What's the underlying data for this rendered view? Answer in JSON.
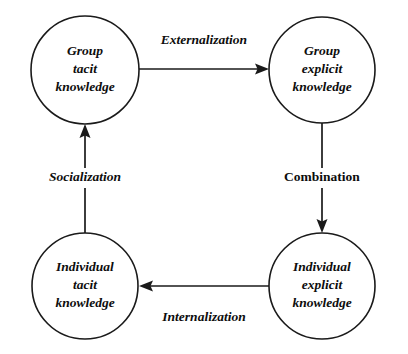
{
  "diagram": {
    "background_color": "#ffffff",
    "stroke_color": "#1a1a1a",
    "text_color": "#0d0d0d",
    "nodes": [
      {
        "id": "group-tacit",
        "lines": [
          "Group",
          "tacit",
          "knowledge"
        ],
        "cx": 85,
        "cy": 70,
        "r": 54
      },
      {
        "id": "group-explicit",
        "lines": [
          "Group",
          "explicit",
          "knowledge"
        ],
        "cx": 322,
        "cy": 70,
        "r": 53
      },
      {
        "id": "individual-tacit",
        "lines": [
          "Individual",
          "tacit",
          "knowledge"
        ],
        "cx": 85,
        "cy": 286,
        "r": 53
      },
      {
        "id": "individual-explicit",
        "lines": [
          "Individual",
          "explicit",
          "knowledge"
        ],
        "cx": 322,
        "cy": 286,
        "r": 53
      }
    ],
    "edges": [
      {
        "id": "externalization",
        "label": "Externalization",
        "from": "group-tacit",
        "to": "group-explicit",
        "direction": "right",
        "italic": true,
        "label_x": 204,
        "label_y": 41
      },
      {
        "id": "combination",
        "label": "Combination",
        "from": "group-explicit",
        "to": "individual-explicit",
        "direction": "down",
        "italic": false,
        "label_x": 322,
        "label_y": 178
      },
      {
        "id": "internalization",
        "label": "Internalization",
        "from": "individual-explicit",
        "to": "individual-tacit",
        "direction": "left",
        "italic": true,
        "label_x": 204,
        "label_y": 318
      },
      {
        "id": "socialization",
        "label": "Socialization",
        "from": "individual-tacit",
        "to": "group-tacit",
        "direction": "up",
        "italic": true,
        "label_x": 85,
        "label_y": 178
      }
    ]
  }
}
